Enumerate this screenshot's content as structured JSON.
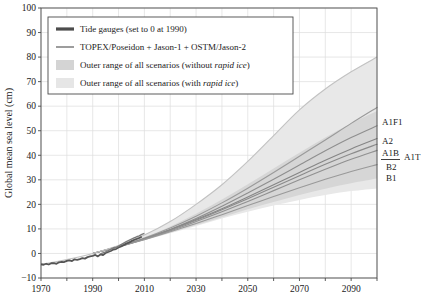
{
  "chart_data": {
    "type": "line",
    "title": "",
    "xlabel": "",
    "ylabel": "Global mean sea level (cm)",
    "xlim": [
      1970,
      2100
    ],
    "ylim": [
      -10,
      100
    ],
    "grid": true,
    "xticks": [
      1970,
      1990,
      2010,
      2030,
      2050,
      2070,
      2090
    ],
    "xtick_labels": [
      "1970",
      "1990",
      "2010",
      "2030",
      "2050",
      "2070",
      "2090"
    ],
    "xminor_step": 10,
    "yticks": [
      -10,
      0,
      10,
      20,
      30,
      40,
      50,
      60,
      70,
      80,
      90,
      100
    ],
    "ytick_labels": [
      "−10",
      "0",
      "10",
      "20",
      "30",
      "40",
      "50",
      "60",
      "70",
      "80",
      "90",
      "100"
    ],
    "legend_position": "upper-left",
    "legend": [
      {
        "key": "tide-gauges",
        "label": "Tide gauges (set to 0 at 1990)",
        "marker": "thick-line",
        "color": "#4c4c4c"
      },
      {
        "key": "satellite",
        "label": "TOPEX/Poseidon + Jason-1 + OSTM/Jason-2",
        "marker": "line",
        "color": "#7d7d7d"
      },
      {
        "key": "band-no-rapid-ice",
        "label": "Outer range of all scenarios (without rapid ice)",
        "label_italic": "rapid ice",
        "marker": "band",
        "color": "#d4d4d4"
      },
      {
        "key": "band-rapid-ice",
        "label": "Outer range of all scenarios (with rapid ice)",
        "label_italic": "rapid ice",
        "marker": "band",
        "color": "#e6e6e6"
      }
    ],
    "annotations": [
      {
        "text": "A1F1",
        "x": 2100,
        "y": 61
      },
      {
        "text": "A2",
        "x": 2100,
        "y": 52
      },
      {
        "text": "A1B",
        "x": 2100,
        "y": 47
      },
      {
        "text": "A1T",
        "x": 2100,
        "y": 45
      },
      {
        "text": "B2",
        "x": 2100,
        "y": 42
      },
      {
        "text": "B1",
        "x": 2100,
        "y": 37
      }
    ],
    "x": [
      1970,
      1980,
      1990,
      2000,
      2010,
      2020,
      2030,
      2040,
      2050,
      2060,
      2070,
      2080,
      2090,
      2100
    ],
    "series": [
      {
        "name": "Outer range of all scenarios (with rapid ice)",
        "type": "band",
        "color": "#e8e8e8",
        "upper": [
          -4.5,
          -2.5,
          0,
          3.2,
          7.5,
          13.0,
          20.0,
          28.0,
          37.5,
          48.0,
          58.5,
          67.0,
          74.0,
          80.0
        ],
        "lower": [
          -4.5,
          -2.5,
          0,
          2.6,
          5.4,
          8.2,
          11.2,
          14.2,
          17.0,
          19.5,
          21.8,
          23.8,
          25.4,
          26.5
        ]
      },
      {
        "name": "Outer range of all scenarios (without rapid ice)",
        "type": "band",
        "color": "#d6d6d6",
        "upper": [
          -4.5,
          -2.5,
          0,
          3.0,
          6.6,
          11.0,
          16.2,
          22.0,
          28.2,
          34.6,
          41.0,
          47.2,
          53.0,
          58.0
        ],
        "lower": [
          -4.5,
          -2.5,
          0,
          2.6,
          5.4,
          8.4,
          11.6,
          14.8,
          18.0,
          21.0,
          23.8,
          26.4,
          28.6,
          30.5
        ]
      },
      {
        "name": "A1F1",
        "type": "line",
        "color": "#9a9a9a",
        "values": [
          null,
          null,
          0,
          2.9,
          6.3,
          10.4,
          15.2,
          20.6,
          26.6,
          33.0,
          39.6,
          46.2,
          53.0,
          59.5
        ]
      },
      {
        "name": "A2",
        "type": "line",
        "color": "#8e8e8e",
        "values": [
          null,
          null,
          0,
          2.8,
          6.0,
          9.8,
          14.2,
          19.2,
          24.6,
          30.2,
          36.0,
          41.8,
          47.2,
          52.0
        ]
      },
      {
        "name": "A1B",
        "type": "line",
        "color": "#858585",
        "values": [
          null,
          null,
          0,
          2.8,
          6.0,
          9.7,
          13.8,
          18.2,
          23.0,
          28.0,
          33.0,
          38.0,
          42.6,
          46.8
        ]
      },
      {
        "name": "A1T",
        "type": "line",
        "color": "#8a8a8a",
        "values": [
          null,
          null,
          0,
          2.8,
          5.9,
          9.5,
          13.5,
          17.8,
          22.3,
          27.0,
          31.7,
          36.3,
          40.6,
          44.5
        ]
      },
      {
        "name": "B2",
        "type": "line",
        "color": "#909090",
        "values": [
          null,
          null,
          0,
          2.7,
          5.8,
          9.2,
          13.0,
          17.0,
          21.2,
          25.6,
          30.0,
          34.3,
          38.4,
          42.0
        ]
      },
      {
        "name": "B1",
        "type": "line",
        "color": "#999999",
        "values": [
          null,
          null,
          0,
          2.7,
          5.6,
          8.8,
          12.2,
          15.8,
          19.5,
          23.2,
          26.8,
          30.2,
          33.4,
          36.2
        ]
      },
      {
        "name": "Tide gauges (set to 0 at 1990)",
        "type": "line",
        "color": "#555555",
        "observed": [
          [
            1970,
            -4.4
          ],
          [
            1971,
            -4.6
          ],
          [
            1972,
            -4.2
          ],
          [
            1973,
            -4.5
          ],
          [
            1974,
            -4.0
          ],
          [
            1975,
            -3.9
          ],
          [
            1976,
            -4.2
          ],
          [
            1977,
            -3.6
          ],
          [
            1978,
            -3.4
          ],
          [
            1979,
            -3.5
          ],
          [
            1980,
            -3.0
          ],
          [
            1981,
            -2.8
          ],
          [
            1982,
            -3.1
          ],
          [
            1983,
            -2.4
          ],
          [
            1984,
            -2.6
          ],
          [
            1985,
            -2.3
          ],
          [
            1986,
            -1.9
          ],
          [
            1987,
            -2.1
          ],
          [
            1988,
            -1.5
          ],
          [
            1989,
            -1.2
          ],
          [
            1990,
            -1.0
          ],
          [
            1991,
            -0.6
          ],
          [
            1992,
            -1.2
          ],
          [
            1993,
            -0.4
          ],
          [
            1994,
            -0.7
          ],
          [
            1995,
            0.2
          ],
          [
            1996,
            0.6
          ],
          [
            1997,
            1.0
          ],
          [
            1998,
            1.6
          ],
          [
            1999,
            1.8
          ],
          [
            2000,
            2.4
          ],
          [
            2001,
            2.9
          ],
          [
            2002,
            3.4
          ],
          [
            2003,
            4.0
          ],
          [
            2004,
            4.4
          ],
          [
            2005,
            5.0
          ],
          [
            2006,
            5.5
          ],
          [
            2007,
            5.9
          ],
          [
            2008,
            6.3
          ],
          [
            2009,
            6.8
          ]
        ]
      },
      {
        "name": "TOPEX/Poseidon + Jason-1 + OSTM/Jason-2",
        "type": "line",
        "color": "#7a7a7a",
        "observed": [
          [
            1993,
            -0.2
          ],
          [
            1994,
            0.2
          ],
          [
            1995,
            0.6
          ],
          [
            1996,
            1.1
          ],
          [
            1997,
            1.7
          ],
          [
            1998,
            2.3
          ],
          [
            1999,
            2.4
          ],
          [
            2000,
            3.0
          ],
          [
            2001,
            3.6
          ],
          [
            2002,
            4.2
          ],
          [
            2003,
            4.8
          ],
          [
            2004,
            5.3
          ],
          [
            2005,
            5.8
          ],
          [
            2006,
            6.3
          ],
          [
            2007,
            6.8
          ],
          [
            2008,
            7.2
          ],
          [
            2009,
            7.8
          ],
          [
            2010,
            8.2
          ]
        ]
      }
    ]
  }
}
